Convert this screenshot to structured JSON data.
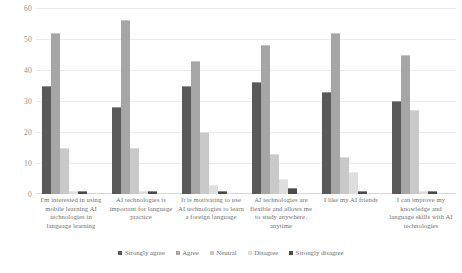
{
  "chart_data": {
    "type": "bar",
    "title": "",
    "subtitle": "",
    "xlabel": "",
    "ylabel": "",
    "ylim": [
      0,
      60
    ],
    "yticks": [
      0,
      10,
      20,
      30,
      40,
      50,
      60
    ],
    "grid": true,
    "legend_position": "bottom",
    "categories": [
      "I'm interested in using mobile learning AI technologies in language learning",
      "AI technologies is important for language practice",
      "It is motivating to use AI technologies to learn a foreign language",
      "AI technologies are flexible and allows me to study anywhere, anytime",
      "I like my AI friends",
      "I can improve my knowledge and language skills with AI technologies"
    ],
    "series": [
      {
        "name": "Strongly agree",
        "color": "#595959",
        "values": [
          35,
          28,
          35,
          36,
          33,
          30
        ]
      },
      {
        "name": "Agree",
        "color": "#a6a6a6",
        "values": [
          52,
          56,
          43,
          48,
          52,
          45
        ]
      },
      {
        "name": "Neutral",
        "color": "#c9c9c9",
        "values": [
          15,
          15,
          20,
          13,
          12,
          27
        ]
      },
      {
        "name": "Disagree",
        "color": "#dedede",
        "values": [
          1,
          1,
          3,
          5,
          7,
          1
        ]
      },
      {
        "name": "Strongly disagree",
        "color": "#4a4a4a",
        "values": [
          1,
          1,
          1,
          2,
          1,
          1
        ]
      }
    ]
  },
  "axis": {
    "y_tick_labels": [
      "60",
      "50",
      "40",
      "30",
      "20",
      "10",
      "0"
    ]
  }
}
